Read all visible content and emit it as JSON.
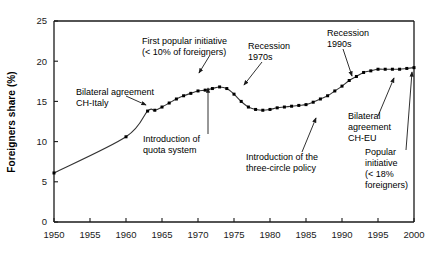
{
  "chart_data": {
    "type": "line",
    "title": "",
    "xlabel": "",
    "ylabel": "Foreigners share (%)",
    "xlim": [
      1950,
      2000
    ],
    "ylim": [
      0,
      25
    ],
    "grid": false,
    "legend": "none",
    "xticks": [
      "1950",
      "1955",
      "1960",
      "1965",
      "1970",
      "1975",
      "1980",
      "1985",
      "1990",
      "1995",
      "2000"
    ],
    "yticks": [
      "0",
      "5",
      "10",
      "15",
      "20",
      "25"
    ],
    "marker": "filled-square",
    "series": [
      {
        "name": "Foreigners share in Switzerland",
        "x": [
          1950,
          1960,
          1963,
          1964,
          1965,
          1966,
          1967,
          1968,
          1969,
          1970,
          1971,
          1972,
          1973,
          1974,
          1975,
          1976,
          1977,
          1978,
          1979,
          1980,
          1981,
          1982,
          1983,
          1984,
          1985,
          1986,
          1987,
          1988,
          1989,
          1990,
          1991,
          1992,
          1993,
          1994,
          1995,
          1996,
          1997,
          1998,
          1999,
          2000
        ],
        "values": [
          6.1,
          10.6,
          13.8,
          13.9,
          14.3,
          14.8,
          15.3,
          15.7,
          16.0,
          16.3,
          16.4,
          16.6,
          16.8,
          16.6,
          15.9,
          15.0,
          14.3,
          14.0,
          13.9,
          14.0,
          14.2,
          14.3,
          14.4,
          14.5,
          14.6,
          14.9,
          15.3,
          15.7,
          16.3,
          16.9,
          17.6,
          18.1,
          18.6,
          18.8,
          19.0,
          19.0,
          19.0,
          19.0,
          19.1,
          19.2
        ]
      }
    ],
    "annotations": [
      {
        "id": "bilateral-ch-italy",
        "lines": [
          "Bilateral agreement",
          "CH-Italy"
        ],
        "target_x": 1964,
        "target_y": 13.9
      },
      {
        "id": "first-popular-initiative",
        "lines": [
          "First popular initiative",
          "(< 10% of foreigners)"
        ],
        "target_x": 1969,
        "target_y": 16.1
      },
      {
        "id": "quota-system",
        "lines": [
          "Introduction of",
          "quota system"
        ],
        "target_x": 1970,
        "target_y": 16.3
      },
      {
        "id": "recession-1970s",
        "lines": [
          "Recession",
          "1970s"
        ],
        "target_x": 1975,
        "target_y": 15.9
      },
      {
        "id": "three-circle-policy",
        "lines": [
          "Introduction of the",
          "three-circle policy"
        ],
        "target_x": 1991,
        "target_y": 17.6
      },
      {
        "id": "recession-1990s",
        "lines": [
          "Recession",
          "1990s"
        ],
        "target_x": 1993,
        "target_y": 18.6
      },
      {
        "id": "bilateral-ch-eu",
        "lines": [
          "Bilateral",
          "agreement",
          "CH-EU"
        ],
        "target_x": 1998,
        "target_y": 19.0
      },
      {
        "id": "popular-initiative-18",
        "lines": [
          "Popular",
          "initiative",
          "(< 18%",
          "foreigners)"
        ],
        "target_x": 2000,
        "target_y": 19.2
      }
    ]
  },
  "annotation_text": {
    "bilateral_ch_italy_l1": "Bilateral agreement",
    "bilateral_ch_italy_l2": "CH-Italy",
    "first_popular_initiative_l1": "First popular initiative",
    "first_popular_initiative_l2": "(< 10% of foreigners)",
    "quota_system_l1": "Introduction of",
    "quota_system_l2": "quota system",
    "recession_1970s_l1": "Recession",
    "recession_1970s_l2": "1970s",
    "three_circle_l1": "Introduction of the",
    "three_circle_l2": "three-circle policy",
    "recession_1990s_l1": "Recession",
    "recession_1990s_l2": "1990s",
    "bilateral_ch_eu_l1": "Bilateral",
    "bilateral_ch_eu_l2": "agreement",
    "bilateral_ch_eu_l3": "CH-EU",
    "popular_initiative_18_l1": "Popular",
    "popular_initiative_18_l2": "initiative",
    "popular_initiative_18_l3": "(< 18%",
    "popular_initiative_18_l4": "foreigners)"
  },
  "colors": {
    "axis": "#1a1a1a",
    "line": "#333333",
    "marker": "#000000",
    "background": "#ffffff",
    "text": "#1a1a1a"
  }
}
